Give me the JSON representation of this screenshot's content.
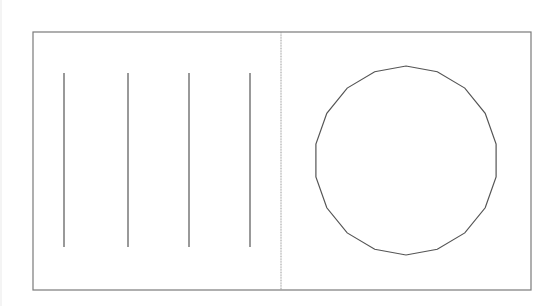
{
  "figure": {
    "width": 553,
    "height": 306,
    "background": "#ffffff",
    "stroke_color": "#555555",
    "frame_color": "#7a7a7a",
    "divider_color": "#9a9a9a",
    "frame": {
      "x1": 33,
      "y1": 32,
      "x2": 531,
      "y2": 290
    },
    "divider": {
      "x": 281,
      "y1": 32,
      "y2": 290
    },
    "left_panel": {
      "shape": "vertical-lines",
      "lines": [
        {
          "x": 64,
          "y1": 73,
          "y2": 247
        },
        {
          "x": 128,
          "y1": 73,
          "y2": 247
        },
        {
          "x": 189,
          "y1": 73,
          "y2": 247
        },
        {
          "x": 250,
          "y1": 73,
          "y2": 247
        }
      ]
    },
    "right_panel": {
      "shape": "polygon-circle",
      "center": {
        "x": 406,
        "y": 160.5
      },
      "radius_x": 91.5,
      "radius_y": 94.5,
      "sides": 18
    }
  }
}
